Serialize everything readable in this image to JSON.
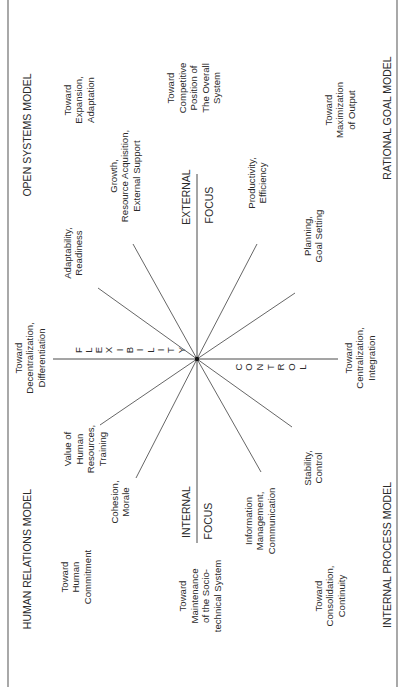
{
  "diagram": {
    "colors": {
      "ink": "#2a2a2a",
      "line": "#555555",
      "frame": "#7a7a7a",
      "background": "#ffffff"
    },
    "frame": {
      "left": 8,
      "right": 397,
      "top": 0,
      "bottom": 687
    },
    "center": {
      "x": 197,
      "y": 359
    },
    "axes": {
      "vertical": {
        "x": 197,
        "y1": 174,
        "y2": 543,
        "top_label": "EXTERNAL FOCUS",
        "bottom_label": "INTERNAL FOCUS"
      },
      "horizontal": {
        "y": 359,
        "x1": 53,
        "x2": 338,
        "left_label": "FLEXIBILITY",
        "right_label": "CONTROL"
      }
    },
    "spokes": [
      {
        "name": "spoke-growth",
        "x2": 133,
        "y2": 244
      },
      {
        "name": "spoke-adaptability",
        "x2": 98,
        "y2": 288
      },
      {
        "name": "spoke-productivity",
        "x2": 257,
        "y2": 244
      },
      {
        "name": "spoke-planning",
        "x2": 295,
        "y2": 293
      },
      {
        "name": "spoke-human-resources",
        "x2": 100,
        "y2": 425
      },
      {
        "name": "spoke-cohesion",
        "x2": 136,
        "y2": 478
      },
      {
        "name": "spoke-stability",
        "x2": 292,
        "y2": 427
      },
      {
        "name": "spoke-information",
        "x2": 261,
        "y2": 472
      }
    ],
    "models": [
      {
        "name": "open-systems-model",
        "lines": [
          "OPEN SYSTEMS MODEL"
        ],
        "x": 27,
        "y": 135,
        "size": 10.5
      },
      {
        "name": "rational-goal-model",
        "lines": [
          "RATIONAL GOAL MODEL"
        ],
        "x": 387,
        "y": 118,
        "size": 10.5
      },
      {
        "name": "human-relations-model",
        "lines": [
          "HUMAN RELATIONS MODEL"
        ],
        "x": 27,
        "y": 559,
        "size": 10.5
      },
      {
        "name": "internal-process-model",
        "lines": [
          "INTERNAL PROCESS MODEL"
        ],
        "x": 387,
        "y": 555,
        "size": 10.5
      }
    ],
    "labels": [
      {
        "name": "toward-expansion",
        "lines": [
          "Toward",
          "Expansion,",
          "Adaptation"
        ],
        "x": 79,
        "y": 100,
        "align": "stagger"
      },
      {
        "name": "toward-competitive-position",
        "lines": [
          "Toward",
          "Competitive",
          "Position of",
          "The Overall",
          "System"
        ],
        "x": 194,
        "y": 88,
        "align": "stagger"
      },
      {
        "name": "toward-maximization",
        "lines": [
          "Toward",
          "Maximization",
          "of Output"
        ],
        "x": 340,
        "y": 110,
        "align": "stagger"
      },
      {
        "name": "growth-resource-acquisition",
        "lines": [
          "Growth,",
          "Resource Acquisition,",
          "External Support"
        ],
        "x": 125,
        "y": 176,
        "align": "start"
      },
      {
        "name": "productivity-efficiency",
        "lines": [
          "Productivity,",
          "Efficiency"
        ],
        "x": 257,
        "y": 183,
        "align": "start"
      },
      {
        "name": "adaptability-readiness",
        "lines": [
          "Adaptability,",
          "Readiness"
        ],
        "x": 73,
        "y": 253,
        "align": "start"
      },
      {
        "name": "planning-goal-setting",
        "lines": [
          "Planning,",
          "Goal Setting"
        ],
        "x": 313,
        "y": 236,
        "align": "start"
      },
      {
        "name": "toward-decentralization",
        "lines": [
          "Toward",
          "Decentralization,",
          "Differentiation"
        ],
        "x": 30,
        "y": 358,
        "align": "stagger"
      },
      {
        "name": "toward-centralization",
        "lines": [
          "Toward",
          "Centralization,",
          "Integration"
        ],
        "x": 360,
        "y": 358,
        "align": "stagger"
      },
      {
        "name": "value-of-human-resources",
        "lines": [
          "Value of",
          "Human",
          "Resources,",
          "Training"
        ],
        "x": 85,
        "y": 449,
        "align": "start"
      },
      {
        "name": "stability-control",
        "lines": [
          "Stability,",
          "Control"
        ],
        "x": 313,
        "y": 468,
        "align": "start"
      },
      {
        "name": "cohesion-morale",
        "lines": [
          "Cohesion,",
          "Morale"
        ],
        "x": 120,
        "y": 502,
        "align": "start"
      },
      {
        "name": "information-management",
        "lines": [
          "Information",
          "Management,",
          "Communication"
        ],
        "x": 260,
        "y": 521,
        "align": "start"
      },
      {
        "name": "toward-human-commitment",
        "lines": [
          "Toward",
          "Human",
          "Commitment"
        ],
        "x": 76,
        "y": 577,
        "align": "stagger"
      },
      {
        "name": "toward-maintenance",
        "lines": [
          "Toward",
          "Maintenance",
          "of the Socio-",
          "technical System"
        ],
        "x": 200,
        "y": 596,
        "align": "stagger"
      },
      {
        "name": "toward-consolidation",
        "lines": [
          "Toward",
          "Consolidation,",
          "Continuity"
        ],
        "x": 330,
        "y": 596,
        "align": "stagger"
      }
    ],
    "focus_labels": [
      {
        "name": "external-label",
        "text": "EXTERNAL",
        "x": 186,
        "y": 197
      },
      {
        "name": "external-focus-label",
        "text": "FOCUS",
        "x": 209,
        "y": 205
      },
      {
        "name": "internal-label",
        "text": "INTERNAL",
        "x": 186,
        "y": 512
      },
      {
        "name": "internal-focus-label",
        "text": "FOCUS",
        "x": 208,
        "y": 521
      }
    ],
    "flexibility_letters": {
      "text": "FLEXIBILITY",
      "y": 350,
      "x_start": 78,
      "x_end": 181
    },
    "control_letters": {
      "text": "CONTROL",
      "y": 367,
      "x_start": 238,
      "x_end": 302
    }
  }
}
